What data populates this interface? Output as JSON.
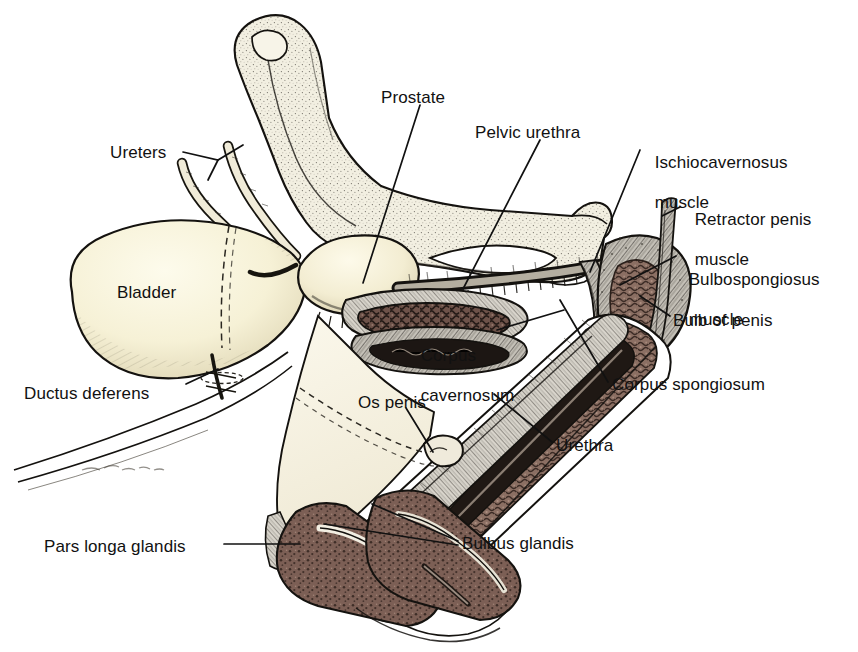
{
  "figure": {
    "background_color": "#ffffff",
    "ink_color": "#111111",
    "signature": "artist-signature"
  },
  "palette": {
    "background": "#ffffff",
    "ink": "#111111",
    "bone_fill": "#f2efe1",
    "bone_stipple": "#4a4640",
    "bladder_fill": "#f6f1d6",
    "bladder_shadow": "#6d6656",
    "prostate_fill": "#f4eed4",
    "erectile_tissue": "#8b6f63",
    "erectile_tissue_dark": "#6d5249",
    "spongy_tissue": "#7c5f55",
    "muscle_sheath": "#b9b5ad",
    "muscle_dark": "#55514a",
    "os_penis_fill": "#efeadb",
    "prepuce_fill": "#f7f3e4"
  },
  "labels": [
    {
      "id": "ureters",
      "text": "Ureters",
      "lines": [
        "Ureters"
      ],
      "x": 110,
      "y": 143,
      "align": "left",
      "leader": true
    },
    {
      "id": "prostate",
      "text": "Prostate",
      "lines": [
        "Prostate"
      ],
      "x": 381,
      "y": 88,
      "align": "left",
      "leader": true
    },
    {
      "id": "pelvic-urethra",
      "text": "Pelvic urethra",
      "lines": [
        "Pelvic urethra"
      ],
      "x": 475,
      "y": 123,
      "align": "left",
      "leader": true
    },
    {
      "id": "ischiocavernosus",
      "text": "Ischiocavernosus muscle",
      "lines": [
        "Ischiocavernosus",
        "muscle"
      ],
      "x": 645,
      "y": 133,
      "align": "left",
      "leader": true
    },
    {
      "id": "retractor-penis",
      "text": "Retractor penis muscle",
      "lines": [
        "Retractor penis",
        "muscle"
      ],
      "x": 685,
      "y": 190,
      "align": "left",
      "leader": true
    },
    {
      "id": "bulbospongiosus",
      "text": "Bulbospongiosus muscle",
      "lines": [
        "Bulbospongiosus",
        "muscle"
      ],
      "x": 679,
      "y": 250,
      "align": "left",
      "leader": true
    },
    {
      "id": "bulb-of-penis",
      "text": "Bulb of penis",
      "lines": [
        "Bulb of penis"
      ],
      "x": 673,
      "y": 311,
      "align": "left",
      "leader": true
    },
    {
      "id": "bladder",
      "text": "Bladder",
      "lines": [
        "Bladder"
      ],
      "x": 117,
      "y": 283,
      "align": "left",
      "leader": false
    },
    {
      "id": "corpus-cavernosum",
      "text": "Corpus cavernosum",
      "lines": [
        "Corpus",
        "cavernosum"
      ],
      "x": 411,
      "y": 326,
      "align": "left",
      "leader": true
    },
    {
      "id": "corpus-spongiosum",
      "text": "Corpus spongiosum",
      "lines": [
        "Corpus spongiosum"
      ],
      "x": 612,
      "y": 375,
      "align": "left",
      "leader": true
    },
    {
      "id": "ductus-deferens",
      "text": "Ductus deferens",
      "lines": [
        "Ductus deferens"
      ],
      "x": 24,
      "y": 384,
      "align": "left",
      "leader": true
    },
    {
      "id": "os-penis",
      "text": "Os penis",
      "lines": [
        "Os penis"
      ],
      "x": 358,
      "y": 393,
      "align": "left",
      "leader": true
    },
    {
      "id": "urethra",
      "text": "Urethra",
      "lines": [
        "Urethra"
      ],
      "x": 556,
      "y": 436,
      "align": "left",
      "leader": true
    },
    {
      "id": "bulbus-glandis",
      "text": "Bulbus glandis",
      "lines": [
        "Bulbus glandis"
      ],
      "x": 462,
      "y": 534,
      "align": "left",
      "leader": true
    },
    {
      "id": "pars-longa-glandis",
      "text": "Pars longa glandis",
      "lines": [
        "Pars longa glandis"
      ],
      "x": 44,
      "y": 537,
      "align": "left",
      "leader": true
    }
  ],
  "structures": [
    {
      "id": "ilium",
      "name": "Ilium (pelvic bone)",
      "fill": "#f2efe1"
    },
    {
      "id": "ischium",
      "name": "Ischium",
      "fill": "#f2efe1"
    },
    {
      "id": "obturator-foramen",
      "name": "Obturator foramen",
      "fill": "#ffffff"
    },
    {
      "id": "urinary-bladder",
      "name": "Urinary bladder",
      "fill": "#f6f1d6"
    },
    {
      "id": "left-ureter",
      "name": "Left ureter",
      "fill": "#efe9d6"
    },
    {
      "id": "right-ureter",
      "name": "Right ureter",
      "fill": "#efe9d6"
    },
    {
      "id": "prostate-gland",
      "name": "Prostate gland",
      "fill": "#f4eed4"
    },
    {
      "id": "pelvic-urethra-seg",
      "name": "Pelvic urethra",
      "fill": "#cfcabb"
    },
    {
      "id": "ductus-deferens-seg",
      "name": "Ductus deferens",
      "fill": "#efe9d6"
    },
    {
      "id": "penis-bulb",
      "name": "Bulb of the penis",
      "fill": "#8b6f63"
    },
    {
      "id": "penis-shaft",
      "name": "Penile shaft (sectioned)",
      "fill": "#8b6f63"
    },
    {
      "id": "os-penis-bone",
      "name": "Os penis",
      "fill": "#efeadb"
    },
    {
      "id": "bulbus-glandis-body",
      "name": "Bulbus glandis",
      "fill": "#7c5f55"
    },
    {
      "id": "pars-longa-body",
      "name": "Pars longa glandis",
      "fill": "#7c5f55"
    },
    {
      "id": "prepuce",
      "name": "Prepuce / skin fold",
      "fill": "#f7f3e4"
    }
  ]
}
